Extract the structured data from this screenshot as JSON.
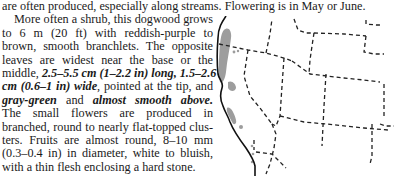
{
  "top_line": "are often produced, especially along streams. Flowering is in May or June.",
  "paragraph": {
    "lines": [
      {
        "parts": [
          {
            "t": "More often a shrub, this dogwood grows",
            "b": false
          }
        ]
      },
      {
        "parts": [
          {
            "t": "to 6 m (20 ft) with reddish-purple to",
            "b": false
          }
        ]
      },
      {
        "parts": [
          {
            "t": "brown, smooth branchlets. The opposite",
            "b": false
          }
        ]
      },
      {
        "parts": [
          {
            "t": "leaves are widest near the base or the",
            "b": false
          }
        ]
      },
      {
        "parts": [
          {
            "t": "middle, ",
            "b": false
          },
          {
            "t": "2.5–5.5 cm (1–2.2 in) long, 1.5–2.6",
            "b": true
          }
        ]
      },
      {
        "parts": [
          {
            "t": "cm (0.6–1 in) wide",
            "b": true
          },
          {
            "t": ", pointed at the tip, and",
            "b": false
          }
        ]
      },
      {
        "parts": [
          {
            "t": "gray-green",
            "b": true
          },
          {
            "t": " and ",
            "b": false
          },
          {
            "t": "almost smooth above.",
            "b": true
          }
        ]
      },
      {
        "parts": [
          {
            "t": "The small flowers are produced in",
            "b": false
          }
        ]
      },
      {
        "parts": [
          {
            "t": "branched, round to nearly flat-topped clus-",
            "b": false
          }
        ]
      },
      {
        "parts": [
          {
            "t": "ters. Fruits are almost round, 8–10 mm",
            "b": false
          }
        ]
      },
      {
        "parts": [
          {
            "t": "(0.3–0.4 in) in diameter, white to bluish,",
            "b": false
          }
        ]
      },
      {
        "parts": [
          {
            "t": "with a thin flesh enclosing a hard stone.",
            "b": false
          }
        ]
      }
    ]
  },
  "map": {
    "description": "Range map of western North America with dashed state borders",
    "range_color": "#8c8c8c",
    "coast_color": "#111111",
    "border_color": "#222222"
  }
}
